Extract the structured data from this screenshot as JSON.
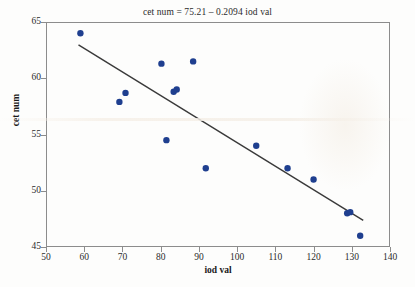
{
  "figure": {
    "title": "cet num = 75.21 – 0.2094 iod val",
    "background_color": "#fdfdfc",
    "frame_color": "#8c8c8c"
  },
  "axes": {
    "x": {
      "label": "iod val",
      "ticks": [
        "50",
        "60",
        "70",
        "80",
        "90",
        "100",
        "110",
        "120",
        "130",
        "140"
      ],
      "min": 50,
      "max": 140
    },
    "y": {
      "label": "cet num",
      "ticks": [
        "45",
        "50",
        "55",
        "60",
        "65"
      ],
      "min": 45,
      "max": 65
    }
  },
  "chart_data": {
    "type": "scatter",
    "title": "cet num = 75.21 – 0.2094 iod val",
    "xlabel": "iod val",
    "ylabel": "cet num",
    "xlim": [
      50,
      140
    ],
    "ylim": [
      45,
      65
    ],
    "xticks": [
      50,
      60,
      70,
      80,
      90,
      100,
      110,
      120,
      130,
      140
    ],
    "yticks": [
      45,
      50,
      55,
      60,
      65
    ],
    "grid": false,
    "legend": null,
    "marker_color": "#1f3f8f",
    "marker_size": 3.2,
    "line_color": "#3a3a3a",
    "series": [
      {
        "name": "observations",
        "marker": "filled-circle",
        "points": [
          {
            "x": 59.0,
            "y": 64.0
          },
          {
            "x": 69.2,
            "y": 57.9
          },
          {
            "x": 70.8,
            "y": 58.7
          },
          {
            "x": 80.2,
            "y": 61.3
          },
          {
            "x": 81.5,
            "y": 54.5
          },
          {
            "x": 83.4,
            "y": 58.8
          },
          {
            "x": 84.2,
            "y": 59.0
          },
          {
            "x": 88.5,
            "y": 61.5
          },
          {
            "x": 91.8,
            "y": 52.0
          },
          {
            "x": 105.0,
            "y": 54.0
          },
          {
            "x": 113.2,
            "y": 52.0
          },
          {
            "x": 120.0,
            "y": 51.0
          },
          {
            "x": 128.8,
            "y": 48.0
          },
          {
            "x": 129.6,
            "y": 48.1
          },
          {
            "x": 132.2,
            "y": 46.0
          }
        ]
      }
    ],
    "fit_line": {
      "name": "regression-line",
      "equation": "cet num = 75.21 – 0.2094 iod val",
      "intercept": 75.21,
      "slope": -0.2094,
      "x_start": 58.5,
      "x_end": 133.0
    }
  }
}
